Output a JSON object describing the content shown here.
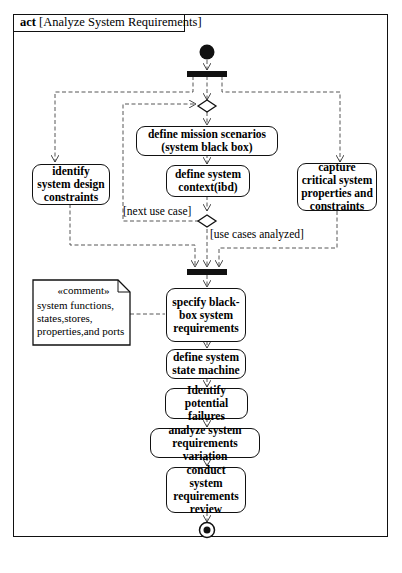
{
  "diagram": {
    "frame_kind": "act",
    "frame_title": "[Analyze System Requirements]",
    "actions": [
      {
        "id": "define_mission",
        "label": "define mission scenarios (system black box)"
      },
      {
        "id": "define_context",
        "label": "define system context(ibd)"
      },
      {
        "id": "identify_constraints",
        "label": "identify system design constraints"
      },
      {
        "id": "capture_properties",
        "label": "capture critical system properties and constraints"
      },
      {
        "id": "specify_blackbox",
        "label": "specify black-box system requirements"
      },
      {
        "id": "define_state_machine",
        "label": "define system state machine"
      },
      {
        "id": "identify_failures",
        "label": "Identify potential failures"
      },
      {
        "id": "analyze_variation",
        "label": "analyze system requirements variation"
      },
      {
        "id": "conduct_review",
        "label": "conduct system requirements review"
      }
    ],
    "guards": {
      "loop": "[next use case]",
      "exit": "[use cases analyzed]"
    },
    "comment": {
      "stereotype": "«comment»",
      "text": "system functions, states,stores, properties,and ports"
    },
    "nodes": [
      "initial",
      "fork",
      "merge",
      "decision",
      "join",
      "final"
    ]
  }
}
